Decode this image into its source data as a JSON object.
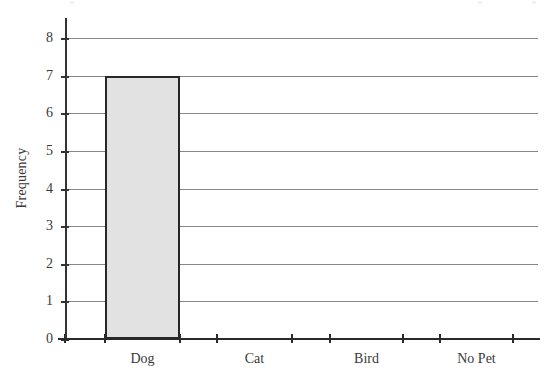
{
  "chart_data": {
    "type": "bar",
    "title": "",
    "subtitle": "",
    "xlabel": "",
    "ylabel": "Frequency",
    "categories": [
      "Dog",
      "Cat",
      "Bird",
      "No Pet"
    ],
    "values": [
      7,
      0,
      0,
      0
    ],
    "series": [
      {
        "name": "Frequency",
        "values": [
          7,
          0,
          0,
          0
        ]
      }
    ],
    "ylim": [
      0,
      8
    ],
    "ytick_labels": [
      "0",
      "1",
      "2",
      "3",
      "4",
      "5",
      "6",
      "7",
      "8"
    ],
    "ytick_values": [
      0,
      1,
      2,
      3,
      4,
      5,
      6,
      7,
      8
    ],
    "grid": "horizontal",
    "legend": "none",
    "annotations": [],
    "colors": {
      "background": "#ffffff",
      "bar_fill": "#e2e2e2",
      "bar_border": "#272727",
      "gridline": "#868686",
      "axis": "#2a2a2a",
      "text": "#3a3a3a"
    }
  },
  "axes": {
    "y_title": "Frequency"
  }
}
